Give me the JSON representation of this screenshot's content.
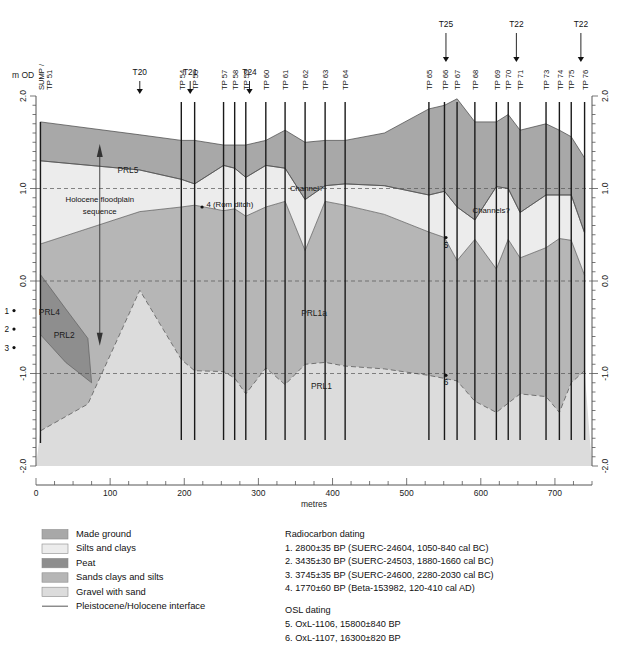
{
  "figure": {
    "yaxis": {
      "title": "m OD",
      "ticks": [
        "2.0",
        "1.0",
        "0.0",
        "-1.0",
        "-2.0"
      ],
      "tick_values": [
        2.0,
        1.0,
        0.0,
        -1.0,
        -2.0
      ],
      "range": [
        -2.0,
        2.0
      ]
    },
    "yaxis_right": {
      "ticks": [
        "2.0",
        "1.0",
        "0.0",
        "-1.0",
        "-2.0"
      ]
    },
    "xaxis": {
      "title": "metres",
      "ticks": [
        "0",
        "100",
        "200",
        "300",
        "400",
        "500",
        "600",
        "700"
      ],
      "tick_values": [
        0,
        100,
        200,
        300,
        400,
        500,
        600,
        700
      ],
      "range": [
        0,
        750
      ]
    },
    "transects": [
      {
        "label": "T20",
        "x": 140
      },
      {
        "label": "T21",
        "x": 208
      },
      {
        "label": "T24",
        "x": 288
      },
      {
        "label": "T25",
        "x": 553
      },
      {
        "label": "T22",
        "x": 648
      },
      {
        "label": "T22",
        "x": 735
      }
    ],
    "boreholes": [
      {
        "label": "SUMP /",
        "label2": "TP 51",
        "x": 6
      },
      {
        "label": "TP 54",
        "x": 196
      },
      {
        "label": "TP 55",
        "x": 214
      },
      {
        "label": "TP 57",
        "x": 253
      },
      {
        "label": "TP 58",
        "x": 268
      },
      {
        "label": "TP 59",
        "x": 283
      },
      {
        "label": "TP 60",
        "x": 310
      },
      {
        "label": "TP 61",
        "x": 336
      },
      {
        "label": "TP 62",
        "x": 363
      },
      {
        "label": "TP 63",
        "x": 390
      },
      {
        "label": "TP 64",
        "x": 417
      },
      {
        "label": "TP 65",
        "x": 530
      },
      {
        "label": "TP 66",
        "x": 551
      },
      {
        "label": "TP 67",
        "x": 568
      },
      {
        "label": "TP 68",
        "x": 592
      },
      {
        "label": "TP 69",
        "x": 621
      },
      {
        "label": "TP 70",
        "x": 637
      },
      {
        "label": "TP 71",
        "x": 653
      },
      {
        "label": "TP 73",
        "x": 688
      },
      {
        "label": "TP 74",
        "x": 706
      },
      {
        "label": "TP 75",
        "x": 722
      },
      {
        "label": "TP 76",
        "x": 740
      }
    ],
    "unit_labels": [
      {
        "text": "PRL5",
        "x": 124,
        "y": 1.17
      },
      {
        "text": "PRL4",
        "x": 18,
        "y": -0.37
      },
      {
        "text": "PRL2",
        "x": 38,
        "y": -0.62
      },
      {
        "text": "PRL1a",
        "x": 375,
        "y": -0.38
      },
      {
        "text": "PRL1",
        "x": 385,
        "y": -1.17
      }
    ],
    "annotations": [
      {
        "text": "Holocene floodplain",
        "x": 86,
        "y": 0.85
      },
      {
        "text": "sequence",
        "x": 86,
        "y": 0.72
      },
      {
        "text": "4 (Rom ditch)",
        "x": 230,
        "y": 0.8
      },
      {
        "text": "Channel?",
        "x": 365,
        "y": 0.97
      },
      {
        "text": "Channels?",
        "x": 614,
        "y": 0.73
      }
    ],
    "sample_markers": [
      {
        "number": "1",
        "x": -30,
        "y": -0.32
      },
      {
        "number": "2",
        "x": -30,
        "y": -0.52
      },
      {
        "number": "3",
        "x": -30,
        "y": -0.72
      },
      {
        "number": "4",
        "x": 224,
        "y": 0.8
      },
      {
        "number": "5",
        "x": 553,
        "y": 0.47
      },
      {
        "number": "6",
        "x": 553,
        "y": -1.02
      }
    ]
  },
  "legend": {
    "items": [
      {
        "label": "Made ground",
        "color": "#a8a8a8",
        "type": "swatch"
      },
      {
        "label": "Silts and clays",
        "color": "#ececec",
        "type": "swatch"
      },
      {
        "label": "Peat",
        "color": "#8e8e8e",
        "type": "swatch"
      },
      {
        "label": "Sands clays and silts",
        "color": "#b6b6b6",
        "type": "swatch"
      },
      {
        "label": "Gravel with sand",
        "color": "#dcdcdc",
        "type": "swatch"
      },
      {
        "label": "Pleistocene/Holocene interface",
        "color": "#666666",
        "type": "line"
      }
    ]
  },
  "dating": {
    "radiocarbon_heading": "Radiocarbon dating",
    "radiocarbon_items": [
      "1. 2800±35 BP (SUERC-24604, 1050-840 cal BC)",
      "2. 3435±30 BP (SUERC-24503, 1880-1660 cal BC)",
      "3. 3745±35 BP (SUERC-24600, 2280-2030 cal BC)",
      "4. 1770±60 BP (Beta-153982, 120-410 cal AD)"
    ],
    "osl_heading": "OSL dating",
    "osl_items": [
      "5. OxL-1106, 15800±840 BP",
      "6. OxL-1107, 16300±820 BP"
    ]
  },
  "colors": {
    "made_ground": "#a8a8a8",
    "silts_clays": "#ececec",
    "peat": "#8e8e8e",
    "sands_clays_silts": "#b6b6b6",
    "gravel_with_sand": "#dcdcdc",
    "interface_line": "#666666",
    "borehole_line": "#1a1a1a",
    "axis": "#555555"
  },
  "chart_data": {
    "type": "area",
    "title": "",
    "xlabel": "metres",
    "ylabel": "m OD",
    "xlim": [
      0,
      750
    ],
    "ylim": [
      -2.0,
      2.0
    ],
    "grid": false,
    "surfaces": [
      {
        "name": "ground-surface",
        "points": [
          [
            6,
            1.72
          ],
          [
            140,
            1.58
          ],
          [
            196,
            1.52
          ],
          [
            214,
            1.52
          ],
          [
            253,
            1.47
          ],
          [
            268,
            1.47
          ],
          [
            283,
            1.47
          ],
          [
            310,
            1.52
          ],
          [
            336,
            1.63
          ],
          [
            363,
            1.5
          ],
          [
            390,
            1.52
          ],
          [
            417,
            1.52
          ],
          [
            470,
            1.6
          ],
          [
            530,
            1.86
          ],
          [
            551,
            1.9
          ],
          [
            568,
            1.97
          ],
          [
            592,
            1.72
          ],
          [
            621,
            1.72
          ],
          [
            637,
            1.8
          ],
          [
            653,
            1.63
          ],
          [
            688,
            1.7
          ],
          [
            706,
            1.63
          ],
          [
            722,
            1.56
          ],
          [
            740,
            1.33
          ]
        ]
      },
      {
        "name": "base-of-made-ground",
        "points": [
          [
            6,
            1.3
          ],
          [
            140,
            1.2
          ],
          [
            196,
            1.1
          ],
          [
            214,
            1.05
          ],
          [
            253,
            1.25
          ],
          [
            268,
            1.22
          ],
          [
            283,
            1.12
          ],
          [
            310,
            1.25
          ],
          [
            336,
            1.22
          ],
          [
            363,
            0.88
          ],
          [
            390,
            1.03
          ],
          [
            417,
            1.05
          ],
          [
            470,
            1.03
          ],
          [
            530,
            0.93
          ],
          [
            551,
            0.97
          ],
          [
            568,
            0.8
          ],
          [
            592,
            0.66
          ],
          [
            621,
            1.02
          ],
          [
            637,
            1.0
          ],
          [
            653,
            0.74
          ],
          [
            688,
            0.93
          ],
          [
            706,
            0.93
          ],
          [
            722,
            0.93
          ],
          [
            740,
            0.52
          ]
        ]
      },
      {
        "name": "base-of-silts-and-clays",
        "points": [
          [
            6,
            0.4
          ],
          [
            140,
            0.75
          ],
          [
            196,
            0.8
          ],
          [
            214,
            0.82
          ],
          [
            253,
            0.76
          ],
          [
            268,
            0.78
          ],
          [
            283,
            0.7
          ],
          [
            310,
            0.8
          ],
          [
            336,
            0.86
          ],
          [
            363,
            0.33
          ],
          [
            390,
            0.86
          ],
          [
            417,
            0.82
          ],
          [
            470,
            0.72
          ],
          [
            530,
            0.53
          ],
          [
            551,
            0.47
          ],
          [
            568,
            0.22
          ],
          [
            592,
            0.45
          ],
          [
            621,
            0.13
          ],
          [
            637,
            0.45
          ],
          [
            653,
            0.25
          ],
          [
            688,
            0.36
          ],
          [
            706,
            0.46
          ],
          [
            722,
            0.44
          ],
          [
            740,
            0.06
          ]
        ]
      },
      {
        "name": "peat-band-top-left",
        "points": [
          [
            6,
            0.07
          ],
          [
            40,
            -0.3
          ],
          [
            70,
            -0.62
          ]
        ]
      },
      {
        "name": "peat-band-base-left",
        "points": [
          [
            6,
            -0.58
          ],
          [
            40,
            -0.88
          ],
          [
            75,
            -1.1
          ]
        ]
      },
      {
        "name": "pleistocene-holocene-interface",
        "points": [
          [
            6,
            -1.62
          ],
          [
            70,
            -1.33
          ],
          [
            140,
            -0.1
          ],
          [
            196,
            -0.85
          ],
          [
            214,
            -0.97
          ],
          [
            253,
            -0.98
          ],
          [
            268,
            -1.05
          ],
          [
            283,
            -1.22
          ],
          [
            310,
            -0.94
          ],
          [
            336,
            -1.12
          ],
          [
            363,
            -0.9
          ],
          [
            390,
            -0.88
          ],
          [
            417,
            -0.92
          ],
          [
            470,
            -0.95
          ],
          [
            530,
            -1.02
          ],
          [
            568,
            -1.08
          ],
          [
            592,
            -1.3
          ],
          [
            621,
            -1.42
          ],
          [
            653,
            -1.22
          ],
          [
            688,
            -1.25
          ],
          [
            706,
            -1.42
          ],
          [
            722,
            -1.1
          ],
          [
            740,
            -0.97
          ]
        ]
      }
    ],
    "series": [
      {
        "name": "Made ground",
        "color": "#a8a8a8"
      },
      {
        "name": "Silts and clays",
        "color": "#ececec"
      },
      {
        "name": "Peat",
        "color": "#8e8e8e"
      },
      {
        "name": "Sands clays and silts",
        "color": "#b6b6b6"
      },
      {
        "name": "Gravel with sand",
        "color": "#dcdcdc"
      }
    ]
  }
}
